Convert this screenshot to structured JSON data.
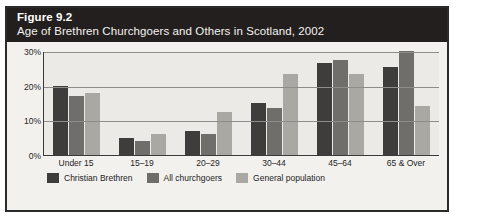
{
  "figure": {
    "number": "Figure 9.2",
    "caption": "Age of Brethren Churchgoers and Others in Scotland, 2002"
  },
  "chart_data": {
    "type": "bar",
    "title": "Age of Brethren Churchgoers and Others in Scotland, 2002",
    "xlabel": "",
    "ylabel": "",
    "ylim": [
      0,
      30
    ],
    "grid": true,
    "legend_position": "bottom-left",
    "categories": [
      "Under 15",
      "15–19",
      "20–29",
      "30–44",
      "45–64",
      "65 & Over"
    ],
    "ytick_labels": [
      "0%",
      "10%",
      "20%",
      "30%"
    ],
    "ytick_values": [
      0,
      10,
      20,
      30
    ],
    "series": [
      {
        "name": "Christian Brethren",
        "color": "#3f3d3c",
        "values": [
          20,
          5,
          7,
          15,
          26.5,
          25.5
        ]
      },
      {
        "name": "All churchgoers",
        "color": "#6f6e6b",
        "values": [
          17,
          4,
          6,
          13.5,
          27.5,
          30
        ]
      },
      {
        "name": "General population",
        "color": "#a9a8a3",
        "values": [
          18,
          6,
          12.5,
          23.5,
          23.5,
          14
        ]
      }
    ]
  }
}
